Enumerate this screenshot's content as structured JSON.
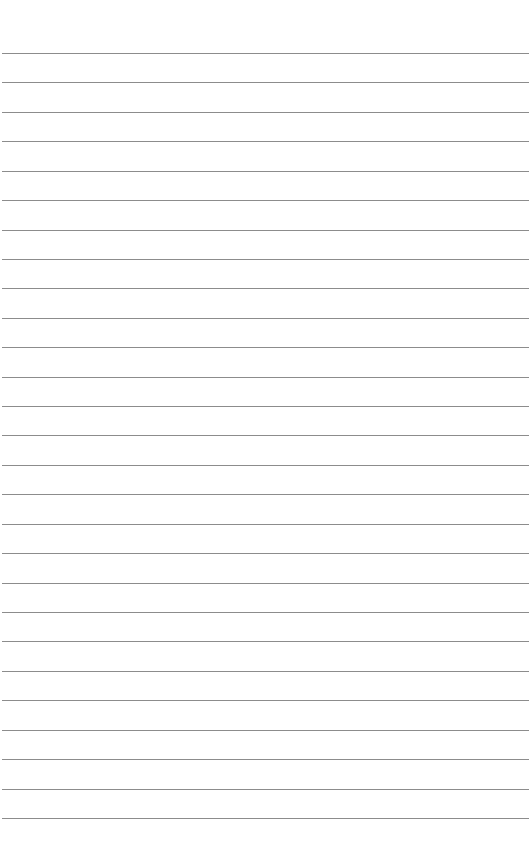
{
  "page": {
    "type": "lined-paper",
    "background_color": "#ffffff",
    "line_color": "#8c8c8c",
    "line_count": 27,
    "first_line_y": 53,
    "line_spacing": 29.42
  }
}
